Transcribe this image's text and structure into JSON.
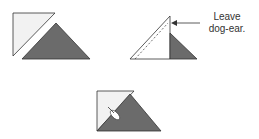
{
  "diagram": {
    "steps": [
      {
        "id": "step-1",
        "description": "Two separate triangles: light triangle and dark triangle"
      },
      {
        "id": "step-2",
        "description": "Triangles sewn together with dashed seam line"
      },
      {
        "id": "step-3",
        "description": "Pressed unit with seam allowance fold"
      }
    ],
    "annotation": {
      "line1": "Leave",
      "line2": "dog-ear."
    },
    "colors": {
      "light_fabric": "#f2f2f2",
      "dark_fabric": "#6b6b6b",
      "outline": "#333333"
    }
  }
}
